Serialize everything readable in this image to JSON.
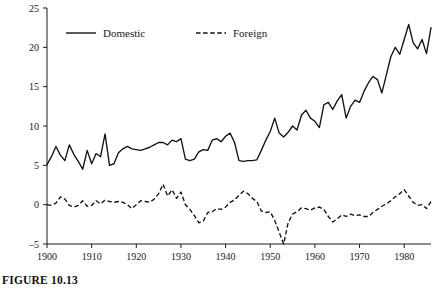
{
  "figure": {
    "caption": "FIGURE 10.13"
  },
  "chart_data": {
    "type": "line",
    "title": "",
    "xlabel": "",
    "ylabel": "% of GDP",
    "xlim": [
      1900,
      1986
    ],
    "ylim": [
      -5,
      25
    ],
    "grid": false,
    "legend_position": "top-inside",
    "x_ticks": [
      1900,
      1910,
      1920,
      1930,
      1940,
      1950,
      1960,
      1970,
      1980
    ],
    "y_ticks": [
      -5,
      0,
      5,
      10,
      15,
      20,
      25
    ],
    "x": [
      1900,
      1901,
      1902,
      1903,
      1904,
      1905,
      1906,
      1907,
      1908,
      1909,
      1910,
      1911,
      1912,
      1913,
      1914,
      1915,
      1916,
      1917,
      1918,
      1919,
      1920,
      1921,
      1922,
      1923,
      1924,
      1925,
      1926,
      1927,
      1928,
      1929,
      1930,
      1931,
      1932,
      1933,
      1934,
      1935,
      1936,
      1937,
      1938,
      1939,
      1940,
      1941,
      1942,
      1943,
      1944,
      1945,
      1946,
      1947,
      1948,
      1949,
      1950,
      1951,
      1952,
      1953,
      1954,
      1955,
      1956,
      1957,
      1958,
      1959,
      1960,
      1961,
      1962,
      1963,
      1964,
      1965,
      1966,
      1967,
      1968,
      1969,
      1970,
      1971,
      1972,
      1973,
      1974,
      1975,
      1976,
      1977,
      1978,
      1979,
      1980,
      1981,
      1982,
      1983,
      1984,
      1985,
      1986
    ],
    "series": [
      {
        "name": "Domestic",
        "style": "solid",
        "values": [
          5.1,
          6.1,
          7.4,
          6.3,
          5.6,
          7.6,
          6.4,
          5.5,
          4.5,
          6.9,
          5.2,
          6.5,
          6.1,
          9.0,
          5.0,
          5.2,
          6.6,
          7.1,
          7.4,
          7.1,
          7.0,
          6.9,
          7.1,
          7.3,
          7.6,
          7.9,
          7.9,
          7.6,
          8.2,
          8.0,
          8.4,
          5.8,
          5.6,
          5.8,
          6.7,
          7.0,
          6.9,
          8.2,
          8.4,
          8.0,
          8.7,
          9.1,
          7.9,
          5.6,
          5.5,
          5.6,
          5.6,
          5.7,
          6.9,
          8.2,
          9.3,
          11.0,
          9.1,
          8.6,
          9.2,
          10.0,
          9.5,
          11.4,
          12.0,
          11.0,
          10.6,
          9.8,
          12.7,
          13.0,
          12.1,
          13.2,
          14.0,
          11.0,
          12.5,
          13.3,
          13.0,
          14.4,
          15.5,
          16.3,
          15.9,
          14.2,
          16.5,
          18.8,
          20.0,
          19.1,
          21.0,
          22.9,
          20.6,
          19.8,
          21.0,
          19.2,
          22.5
        ]
      },
      {
        "name": "Foreign",
        "style": "dashed",
        "values": [
          0.0,
          -0.1,
          0.2,
          1.0,
          0.7,
          -0.1,
          -0.3,
          -0.1,
          0.5,
          -0.2,
          -0.1,
          0.5,
          0.1,
          0.6,
          0.4,
          0.3,
          0.4,
          0.3,
          0.0,
          -0.5,
          0.0,
          0.5,
          0.4,
          0.3,
          0.7,
          1.4,
          2.6,
          1.1,
          1.9,
          0.8,
          1.6,
          0.0,
          -0.6,
          -1.4,
          -2.3,
          -2.1,
          -1.0,
          -0.9,
          -0.5,
          -0.6,
          -0.3,
          0.3,
          0.6,
          1.2,
          1.7,
          1.4,
          0.8,
          0.4,
          -0.8,
          -1.0,
          -0.9,
          -2.0,
          -3.5,
          -5.0,
          -2.3,
          -1.2,
          -0.9,
          -0.4,
          -0.5,
          -0.7,
          -0.4,
          -0.3,
          -0.6,
          -1.5,
          -2.2,
          -1.8,
          -1.3,
          -1.5,
          -1.2,
          -1.4,
          -1.3,
          -1.5,
          -1.5,
          -1.0,
          -0.6,
          -0.2,
          0.1,
          0.5,
          1.0,
          1.4,
          1.9,
          1.1,
          0.3,
          -0.1,
          0.0,
          -0.5,
          0.4
        ]
      }
    ],
    "legend": [
      {
        "label": "Domestic",
        "style": "solid"
      },
      {
        "label": "Foreign",
        "style": "dashed"
      }
    ]
  }
}
